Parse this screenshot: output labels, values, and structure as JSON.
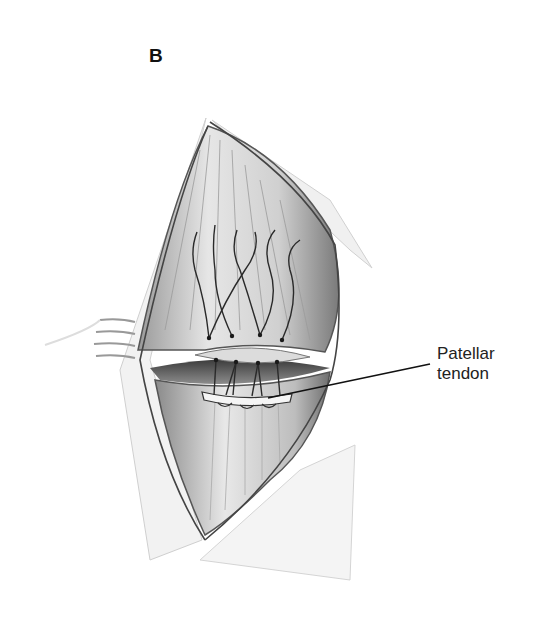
{
  "figure": {
    "panel_label": "B",
    "annotations": [
      {
        "label_line1": "Patellar",
        "label_line2": "tendon",
        "target": "patellar-tendon"
      }
    ],
    "elements": {
      "incision": "elongated diamond-shaped skin incision",
      "upper_structure": "quadriceps tendon / muscle with suture tails",
      "lower_structure": "patellar tendon fibers",
      "suture_count": 4,
      "retractor": "retractor on left wound edge"
    },
    "colors": {
      "ink": "#222222",
      "background": "#ffffff",
      "shade_dark": "#555555",
      "shade_light": "#d8d8d8"
    }
  }
}
